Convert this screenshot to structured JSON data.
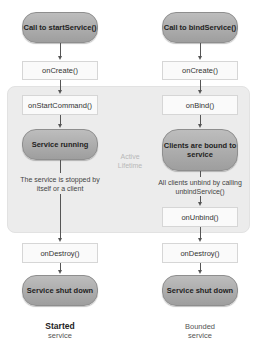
{
  "diagram": {
    "active_region_label": "Active Lifetime",
    "started": {
      "start_pill": "Call to startService()",
      "on_create": "onCreate()",
      "on_start_command": "onStartCommand()",
      "running_pill": "Service running",
      "stop_note": "The service is stopped by itself or a client",
      "on_destroy": "onDestroy()",
      "shutdown_pill": "Service shut down",
      "caption_title": "Started",
      "caption_sub": "service"
    },
    "bounded": {
      "start_pill": "Call to bindService()",
      "on_create": "onCreate()",
      "on_bind": "onBind()",
      "bound_pill": "Clients are bound to service",
      "unbind_note": "All clients unbind by calling unbindService()",
      "on_unbind": "onUnbind()",
      "on_destroy": "onDestroy()",
      "shutdown_pill": "Service shut down",
      "caption_title": "Bounded",
      "caption_sub": "service"
    },
    "colors": {
      "pill_fill": "#a8a8a8",
      "box_fill": "#fafafa",
      "active_region": "#ececec",
      "arrow": "#555555"
    }
  }
}
